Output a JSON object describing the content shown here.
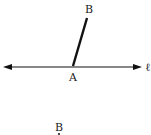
{
  "figure1": {
    "line_label": "ℓ",
    "point_a_label": "A",
    "point_b_label": "B",
    "line": {
      "x1": 5,
      "y1": 67,
      "x2": 141,
      "y2": 67
    },
    "segment": {
      "x1": 73,
      "y1": 66,
      "x2": 87,
      "y2": 18
    },
    "color": "#111111"
  },
  "figure2": {
    "point_b_label": "B"
  }
}
